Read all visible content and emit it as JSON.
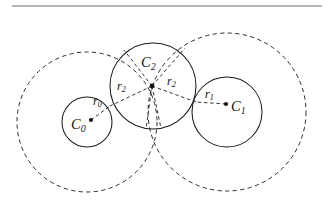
{
  "figure": {
    "title_rule": {
      "name": "horizontal-rule",
      "x1": 12,
      "y1": 6,
      "x2": 322,
      "y2": 6,
      "color": "#6a6a6a"
    },
    "canvas": {
      "width": 328,
      "height": 211,
      "background": "#ffffff"
    },
    "stroke_color": "#1c1c1c",
    "dash_color": "#2a2a2a",
    "solid_circles": [
      {
        "id": "C0",
        "name": "circle-c0",
        "cx": 87,
        "cy": 122,
        "r": 25
      },
      {
        "id": "C1",
        "name": "circle-c1",
        "cx": 227,
        "cy": 112,
        "r": 35
      },
      {
        "id": "C2",
        "name": "circle-c2",
        "cx": 153,
        "cy": 86,
        "r": 43
      }
    ],
    "dashed_circles": [
      {
        "id": "D0",
        "name": "dashed-circle-c0",
        "cx": 87,
        "cy": 122,
        "r": 70
      },
      {
        "id": "D1",
        "name": "dashed-circle-c1",
        "cx": 227,
        "cy": 112,
        "r": 79
      }
    ],
    "center_dots": [
      {
        "id": "dot-c0",
        "name": "center-dot-c0",
        "cx": 91,
        "cy": 120,
        "r": 2.1
      },
      {
        "id": "dot-c1",
        "name": "center-dot-c1",
        "cx": 226,
        "cy": 104,
        "r": 2.1
      },
      {
        "id": "dot-c2",
        "name": "center-dot-c2",
        "cx": 152,
        "cy": 86,
        "r": 2.4
      }
    ],
    "radius_lines": [
      {
        "id": "r2-to-c0",
        "name": "radius-line-r2-left",
        "x1": 152,
        "y1": 86,
        "x2": 110,
        "y2": 106
      },
      {
        "id": "r2-to-c1",
        "name": "radius-line-r2-right",
        "x1": 152,
        "y1": 86,
        "x2": 196,
        "y2": 102
      },
      {
        "id": "r2-up-left",
        "name": "radius-line-r2-up-left",
        "x1": 152,
        "y1": 86,
        "x2": 124,
        "y2": 50
      },
      {
        "id": "r2-up-right",
        "name": "radius-line-r2-up-right",
        "x1": 152,
        "y1": 86,
        "x2": 185,
        "y2": 48
      },
      {
        "id": "r2-down-left",
        "name": "radius-line-r2-down-left",
        "x1": 152,
        "y1": 86,
        "x2": 146,
        "y2": 129
      },
      {
        "id": "r2-down-right",
        "name": "radius-line-r2-down-right",
        "x1": 152,
        "y1": 86,
        "x2": 161,
        "y2": 128
      },
      {
        "id": "r0-line",
        "name": "radius-line-r0",
        "x1": 91,
        "y1": 120,
        "x2": 110,
        "y2": 106
      },
      {
        "id": "r1-line",
        "name": "radius-line-r1",
        "x1": 226,
        "y1": 104,
        "x2": 196,
        "y2": 102
      }
    ],
    "labels": [
      {
        "id": "C0",
        "name": "label-c0",
        "base": "C",
        "sub": "0",
        "x": 71,
        "y": 117,
        "size": "lbl-c"
      },
      {
        "id": "C1",
        "name": "label-c1",
        "base": "C",
        "sub": "1",
        "x": 231,
        "y": 99,
        "size": "lbl-c"
      },
      {
        "id": "C2",
        "name": "label-c2",
        "base": "C",
        "sub": "2",
        "x": 141,
        "y": 55,
        "size": "lbl-c"
      },
      {
        "id": "r0",
        "name": "label-r0",
        "base": "r",
        "sub": "0",
        "x": 93,
        "y": 95,
        "size": "lbl-r"
      },
      {
        "id": "r1",
        "name": "label-r1",
        "base": "r",
        "sub": "1",
        "x": 205,
        "y": 88,
        "size": "lbl-r"
      },
      {
        "id": "r2L",
        "name": "label-r2-left",
        "base": "r",
        "sub": "2",
        "x": 117,
        "y": 80,
        "size": "lbl-r"
      },
      {
        "id": "r2R",
        "name": "label-r2-right",
        "base": "r",
        "sub": "2",
        "x": 167,
        "y": 75,
        "size": "lbl-r"
      }
    ]
  }
}
